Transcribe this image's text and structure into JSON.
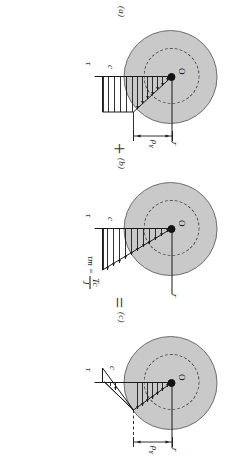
{
  "figure": {
    "type": "elastoplastic-torsion-stress-distribution",
    "orientation_note": "page scan rotated 90 degrees",
    "panels": [
      {
        "id": "a",
        "label": "(a)",
        "center_label": "O",
        "axis_labels": [
          "r",
          "ρY",
          "c",
          "τ"
        ],
        "radius_label": "c",
        "yield_radius_label": "ρ",
        "yield_radius_sub": "Y",
        "shear_axis_label": "τ",
        "radial_axis_label": "r"
      },
      {
        "id": "b",
        "label": "(b)",
        "center_label": "O",
        "axis_labels": [
          "r",
          "c",
          "τ"
        ],
        "radius_label": "c",
        "shear_axis_label": "τ",
        "radial_axis_label": "r",
        "formula_lhs": "τ",
        "formula_lhs_sub": "m",
        "formula_eq": "=",
        "formula_num": "Tc",
        "formula_den": "J"
      },
      {
        "id": "c",
        "label": "(c)",
        "center_label": "O",
        "axis_labels": [
          "r",
          "ρY",
          "c",
          "τ"
        ],
        "radius_label": "c",
        "yield_radius_label": "ρ",
        "yield_radius_sub": "Y",
        "shear_axis_label": "τ",
        "radial_axis_label": "r"
      }
    ],
    "operators": [
      {
        "id": "plus",
        "symbol": "+"
      },
      {
        "id": "equals",
        "symbol": "="
      }
    ],
    "colors": {
      "disc_fill": "#c9c9c9",
      "disc_stroke": "#6f6f6f",
      "line": "#1a1a1a",
      "label": "#303030"
    }
  }
}
